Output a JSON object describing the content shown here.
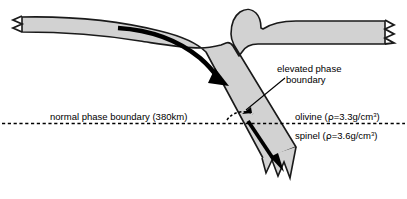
{
  "figure": {
    "kind": "geology-cross-section-diagram",
    "title_visible": false,
    "background_color": "#ffffff",
    "slab_fill_color": "#d2d2d2",
    "slab_outline_color": "#1a1a1a",
    "arrow_color": "#000000",
    "boundary_line_color": "#000000"
  },
  "labels": {
    "normal_boundary": "normal phase boundary (380km)",
    "elevated_boundary_line1": "elevated phase",
    "elevated_boundary_line2": "boundary",
    "olivine_pre": "olivine (",
    "olivine_rho": "ρ",
    "olivine_mid": "=3.3g/cm",
    "olivine_sup": "3",
    "olivine_post": ")",
    "spinel_pre": "spinel (",
    "spinel_rho": "ρ",
    "spinel_mid": "=3.6g/cm",
    "spinel_sup": "3",
    "spinel_post": ")"
  },
  "values": {
    "normal_boundary_depth_km": 380,
    "olivine_density_g_cm3": 3.3,
    "spinel_density_g_cm3": 3.6
  },
  "elements": {
    "upper_plate_left_name": "subducting-lithospheric-slab",
    "upper_plate_right_name": "overriding-plate",
    "descending_slab_name": "descending-slab",
    "flow_arrow_upper_name": "plate-motion-arrow",
    "flow_arrow_lower_name": "slab-sinking-arrow",
    "elevated_arc_name": "elevated-phase-boundary-arc",
    "normal_line_name": "normal-phase-boundary-line",
    "leader_name": "elevated-phase-boundary-leader",
    "bulge_name": "trench-outer-rise-bulge",
    "left_tear_name": "left-torn-edge",
    "right_tear_name": "right-torn-edge",
    "bottom_tear_name": "slab-bottom-torn-edge"
  }
}
